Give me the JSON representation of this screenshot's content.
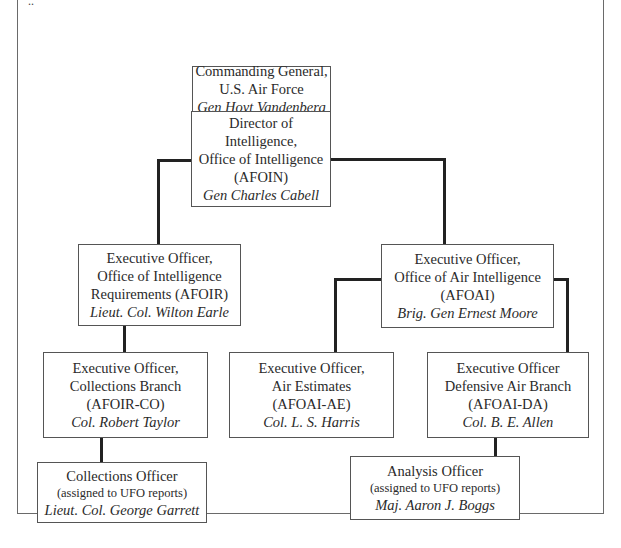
{
  "diagram": {
    "type": "org-chart",
    "nodes": [
      {
        "id": "commanding_general",
        "lines": [
          "Commanding General,",
          "U.S. Air Force"
        ],
        "name": "Gen Hoyt Vandenberg"
      },
      {
        "id": "director_intelligence",
        "lines": [
          "Director of Intelligence,",
          "Office of Intelligence",
          "(AFOIN)"
        ],
        "name": "Gen Charles Cabell"
      },
      {
        "id": "afoir",
        "lines": [
          "Executive Officer,",
          "Office of Intelligence",
          "Requirements (AFOIR)"
        ],
        "name": "Lieut. Col. Wilton Earle"
      },
      {
        "id": "afoai",
        "lines": [
          "Executive Officer,",
          "Office of Air Intelligence",
          "(AFOAI)"
        ],
        "name": "Brig. Gen Ernest Moore"
      },
      {
        "id": "afoir_co",
        "lines": [
          "Executive Officer,",
          "Collections Branch",
          "(AFOIR-CO)"
        ],
        "name": "Col. Robert Taylor"
      },
      {
        "id": "afoai_ae",
        "lines": [
          "Executive Officer,",
          "Air Estimates",
          "(AFOAI-AE)"
        ],
        "name": "Col. L. S. Harris"
      },
      {
        "id": "afoai_da",
        "lines": [
          "Executive Officer",
          "Defensive Air Branch",
          "(AFOAI-DA)"
        ],
        "name": "Col. B. E. Allen"
      },
      {
        "id": "collections_officer",
        "lines": [
          "Collections Officer"
        ],
        "sub": "(assigned to UFO reports)",
        "name": "Lieut. Col. George Garrett"
      },
      {
        "id": "analysis_officer",
        "lines": [
          "Analysis Officer"
        ],
        "sub": "(assigned to UFO reports)",
        "name": "Maj. Aaron J. Boggs"
      }
    ],
    "edges": [
      [
        "commanding_general",
        "director_intelligence"
      ],
      [
        "director_intelligence",
        "afoir"
      ],
      [
        "director_intelligence",
        "afoai"
      ],
      [
        "afoir",
        "afoir_co"
      ],
      [
        "afoir_co",
        "collections_officer"
      ],
      [
        "afoai",
        "afoai_ae"
      ],
      [
        "afoai",
        "afoai_da"
      ],
      [
        "afoai_da",
        "analysis_officer"
      ]
    ]
  },
  "header_fragment": "..",
  "colors": {
    "line": "#222222",
    "border": "#555555",
    "text": "#2a2a2a"
  }
}
